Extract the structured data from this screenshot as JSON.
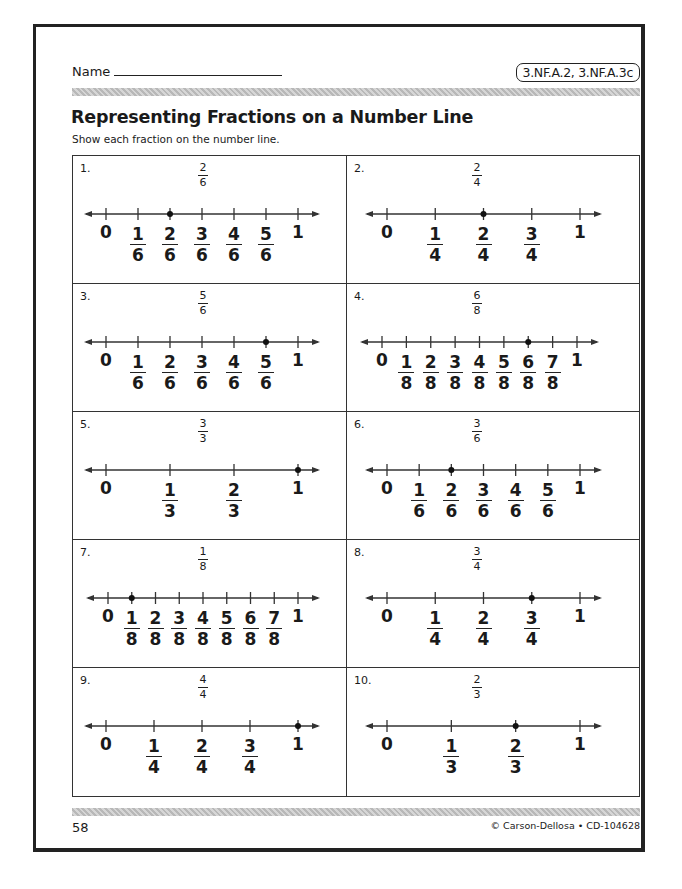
{
  "header": {
    "name_label": "Name",
    "standards": "3.NF.A.2, 3.NF.A.3c"
  },
  "title": "Representing Fractions on a Number Line",
  "instructions": "Show each fraction on the number line.",
  "problems": [
    {
      "number": "1.",
      "target_num": "2",
      "target_den": "6",
      "denominator": 6,
      "marked_index": 2
    },
    {
      "number": "2.",
      "target_num": "2",
      "target_den": "4",
      "denominator": 4,
      "marked_index": 2
    },
    {
      "number": "3.",
      "target_num": "5",
      "target_den": "6",
      "denominator": 6,
      "marked_index": 5
    },
    {
      "number": "4.",
      "target_num": "6",
      "target_den": "8",
      "denominator": 8,
      "marked_index": 6
    },
    {
      "number": "5.",
      "target_num": "3",
      "target_den": "3",
      "denominator": 3,
      "marked_index": 3
    },
    {
      "number": "6.",
      "target_num": "3",
      "target_den": "6",
      "denominator": 6,
      "marked_index": 2
    },
    {
      "number": "7.",
      "target_num": "1",
      "target_den": "8",
      "denominator": 8,
      "marked_index": 1
    },
    {
      "number": "8.",
      "target_num": "3",
      "target_den": "4",
      "denominator": 4,
      "marked_index": 3
    },
    {
      "number": "9.",
      "target_num": "4",
      "target_den": "4",
      "denominator": 4,
      "marked_index": 4
    },
    {
      "number": "10.",
      "target_num": "2",
      "target_den": "3",
      "denominator": 3,
      "marked_index": 2
    }
  ],
  "labels": {
    "zero": "0",
    "one": "1"
  },
  "footer": {
    "page_number": "58",
    "copyright": "© Carson-Dellosa • CD-104628"
  }
}
